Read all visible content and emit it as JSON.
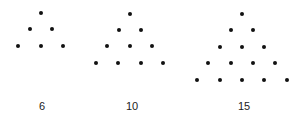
{
  "figure": {
    "dot_color": "#111111",
    "groups": [
      {
        "label": "6",
        "rows": 3,
        "label_pos": [
          42,
          106
        ],
        "dots": [
          [
            41,
            13
          ],
          [
            30,
            29
          ],
          [
            52,
            29
          ],
          [
            18,
            46
          ],
          [
            41,
            46
          ],
          [
            63,
            46
          ]
        ]
      },
      {
        "label": "10",
        "rows": 4,
        "label_pos": [
          132,
          106
        ],
        "dots": [
          [
            130,
            14
          ],
          [
            119,
            30
          ],
          [
            141,
            30
          ],
          [
            107,
            46
          ],
          [
            130,
            46
          ],
          [
            152,
            46
          ],
          [
            96,
            63
          ],
          [
            118,
            63
          ],
          [
            141,
            63
          ],
          [
            163,
            63
          ]
        ]
      },
      {
        "label": "15",
        "rows": 5,
        "label_pos": [
          244,
          106
        ],
        "dots": [
          [
            242,
            14
          ],
          [
            231,
            30
          ],
          [
            253,
            30
          ],
          [
            220,
            47
          ],
          [
            242,
            47
          ],
          [
            264,
            47
          ],
          [
            208,
            63
          ],
          [
            231,
            63
          ],
          [
            253,
            63
          ],
          [
            275,
            63
          ],
          [
            197,
            80
          ],
          [
            220,
            80
          ],
          [
            242,
            80
          ],
          [
            264,
            80
          ],
          [
            287,
            80
          ]
        ]
      }
    ]
  }
}
